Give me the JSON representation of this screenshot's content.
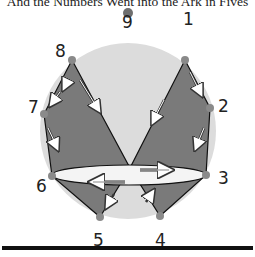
{
  "title": "And the Numbers Went into the Ark in Fives",
  "colors": {
    "circle": "#dcdcdc",
    "shape": "#7a7a7a",
    "ellipse": "#f4f4f4",
    "dot": "#8a8a8a",
    "top_dot": "#6e6e6e",
    "baseline": "#111111"
  },
  "points": [
    {
      "label": "1",
      "x": 185,
      "y": 60,
      "lx": 190,
      "ly": 24
    },
    {
      "label": "2",
      "x": 210,
      "y": 108,
      "lx": 222,
      "ly": 112
    },
    {
      "label": "3",
      "x": 206,
      "y": 175,
      "lx": 220,
      "ly": 182
    },
    {
      "label": "4",
      "x": 160,
      "y": 216,
      "lx": 154,
      "ly": 246
    },
    {
      "label": "5",
      "x": 100,
      "y": 217,
      "lx": 93,
      "ly": 246
    },
    {
      "label": "6",
      "x": 52,
      "y": 176,
      "lx": 36,
      "ly": 192
    },
    {
      "label": "7",
      "x": 44,
      "y": 114,
      "lx": 27,
      "ly": 112
    },
    {
      "label": "8",
      "x": 72,
      "y": 60,
      "lx": 57,
      "ly": 56
    },
    {
      "label": "9",
      "x": 128,
      "y": 13,
      "lx": 122,
      "ly": 27
    }
  ]
}
